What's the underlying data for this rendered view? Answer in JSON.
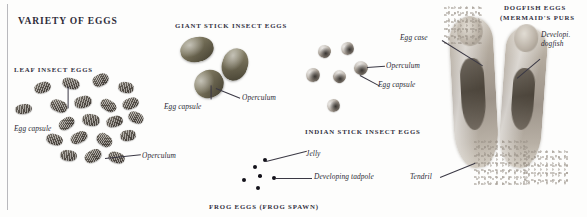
{
  "plate": {
    "title": "VARIETY OF EGGS",
    "background_color": "#fdfdfc",
    "text_color": "#2e2c3a"
  },
  "sections": {
    "leaf": {
      "heading": "LEAF INSECT EGGS",
      "callouts": {
        "egg_capsule": "Egg capsule",
        "operculum": "Operculum"
      }
    },
    "giant": {
      "heading": "GIANT STICK INSECT EGGS",
      "callouts": {
        "egg_capsule": "Egg capsule",
        "operculum": "Operculum"
      }
    },
    "indian": {
      "heading": "INDIAN STICK INSECT EGGS",
      "callouts": {
        "operculum": "Operculum",
        "egg_capsule": "Egg capsule"
      }
    },
    "frog": {
      "heading": "FROG EGGS (FROG SPAWN)",
      "callouts": {
        "jelly": "Jelly",
        "tadpole": "Developing tadpole"
      }
    },
    "dogfish": {
      "heading_line1": "DOGFISH EGGS",
      "heading_line2": "(MERMAID'S PURS",
      "callouts": {
        "egg_case": "Egg case",
        "developing_dogfish": "Developi. dogfish",
        "tendril": "Tendril"
      }
    }
  }
}
